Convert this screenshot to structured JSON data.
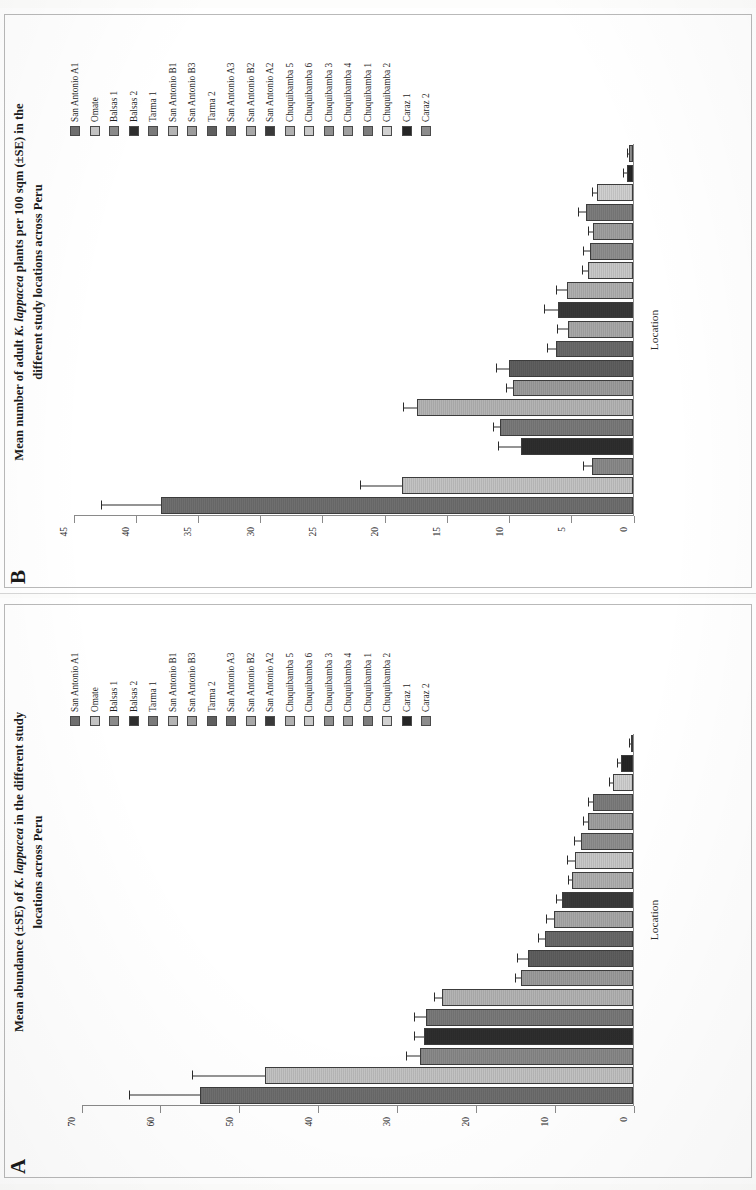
{
  "figure": {
    "xlabel": "Location",
    "series_labels": [
      "San Antonio A1",
      "Omate",
      "Balsas 1",
      "Balsas 2",
      "Tarma 1",
      "San Antonio B1",
      "San Antonio B3",
      "Tarma 2",
      "San Antonio A3",
      "San Antonio B2",
      "San Antonio A2",
      "Chuquibamba 5",
      "Chuquibamba 6",
      "Chuquibamba 3",
      "Chuquibamba 4",
      "Chuquibamba 1",
      "Chuquibamba 2",
      "Caraz 1",
      "Caraz 2"
    ],
    "series_colors": [
      "#6f6f6f",
      "#c3c3c3",
      "#8a8a8a",
      "#2e2e2e",
      "#7a7a7a",
      "#b4b4b4",
      "#9c9c9c",
      "#5f5f5f",
      "#6a6a6a",
      "#a8a8a8",
      "#3a3a3a",
      "#b0b0b0",
      "#c8c8c8",
      "#8f8f8f",
      "#a0a0a0",
      "#7d7d7d",
      "#d0d0d0",
      "#262626",
      "#8c8c8c"
    ]
  },
  "panel_a": {
    "letter": "A",
    "title_line1_pre": "Mean abundance (±SE) of ",
    "title_line1_italic": "K. lappacea",
    "title_line1_post": " in the different study",
    "title_line2": "locations across Peru"
  },
  "panel_b": {
    "letter": "B",
    "title_line1_pre": "Mean number of adult ",
    "title_line1_italic": "K. lappacea",
    "title_line1_post": " plants per 100 sqm (±SE) in the",
    "title_line2": "different study locations across Peru"
  },
  "chart_data": [
    {
      "id": "panel_a",
      "type": "bar",
      "title": "Mean abundance (±SE) of K. lappacea in the different study locations across Peru",
      "xlabel": "Location",
      "ylabel": "Mean No. of individuals per 100 sqm",
      "ylim": [
        0,
        70
      ],
      "yticks": [
        0,
        10,
        20,
        30,
        40,
        50,
        60,
        70
      ],
      "grid": false,
      "legend_position": "right",
      "categories": [
        "San Antonio A1",
        "Omate",
        "Balsas 1",
        "Balsas 2",
        "Tarma 1",
        "San Antonio B1",
        "San Antonio B3",
        "Tarma 2",
        "San Antonio A3",
        "San Antonio B2",
        "San Antonio A2",
        "Chuquibamba 5",
        "Chuquibamba 6",
        "Chuquibamba 3",
        "Chuquibamba 4",
        "Chuquibamba 1",
        "Chuquibamba 2",
        "Caraz 1",
        "Caraz 2"
      ],
      "values": [
        55.0,
        46.8,
        27.0,
        26.5,
        26.3,
        24.3,
        14.2,
        13.3,
        11.2,
        10.1,
        9.0,
        7.7,
        7.4,
        6.6,
        5.7,
        5.1,
        2.6,
        1.5,
        0.3
      ],
      "errors": [
        9.0,
        9.2,
        1.8,
        1.3,
        1.5,
        1.0,
        0.8,
        1.5,
        0.9,
        0.9,
        0.8,
        0.6,
        1.0,
        0.9,
        0.7,
        0.6,
        0.4,
        0.5,
        0.2
      ]
    },
    {
      "id": "panel_b",
      "type": "bar",
      "title": "Mean number of adult K. lappacea plants per 100 sqm (±SE) in the different study locations across Peru",
      "xlabel": "Location",
      "ylabel": "Mean No. of adult individuals per 100 sqm",
      "ylim": [
        0,
        45
      ],
      "yticks": [
        0,
        5,
        10,
        15,
        20,
        25,
        30,
        35,
        40,
        45
      ],
      "grid": false,
      "legend_position": "right",
      "categories": [
        "San Antonio A1",
        "Omate",
        "Balsas 1",
        "Balsas 2",
        "Tarma 1",
        "San Antonio B1",
        "San Antonio B3",
        "Tarma 2",
        "San Antonio A3",
        "San Antonio B2",
        "San Antonio A2",
        "Chuquibamba 5",
        "Chuquibamba 6",
        "Chuquibamba 3",
        "Chuquibamba 4",
        "Chuquibamba 1",
        "Chuquibamba 2",
        "Caraz 1",
        "Caraz 2"
      ],
      "values": [
        38.0,
        18.6,
        3.3,
        9.0,
        10.7,
        17.4,
        9.7,
        10.0,
        6.2,
        5.2,
        6.0,
        5.3,
        3.6,
        3.5,
        3.2,
        3.8,
        2.9,
        0.5,
        0.3
      ],
      "errors": [
        4.8,
        3.4,
        0.7,
        1.9,
        0.6,
        1.1,
        0.5,
        1.0,
        0.7,
        0.9,
        1.2,
        0.9,
        0.5,
        0.5,
        0.4,
        0.6,
        0.4,
        0.3,
        0.2
      ]
    }
  ]
}
